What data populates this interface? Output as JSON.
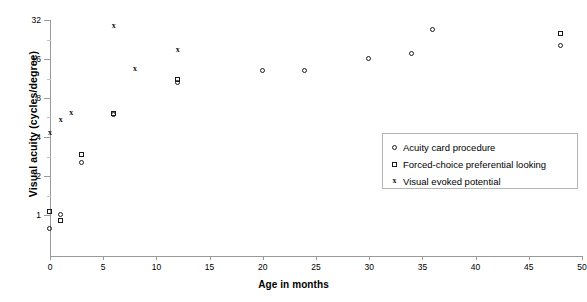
{
  "chart_data": {
    "type": "scatter",
    "title": "",
    "xlabel": "Age in months",
    "ylabel": "Visual acuity (cycles/degree)",
    "xlim": [
      0,
      50
    ],
    "ylim": [
      1,
      32
    ],
    "yscale": "log2",
    "grid": false,
    "legend_position": "center-right",
    "xticks": [
      "0",
      "5",
      "10",
      "15",
      "20",
      "25",
      "30",
      "35",
      "40",
      "45",
      "50"
    ],
    "yticks": [
      "1",
      "2",
      "4",
      "8",
      "16",
      "32"
    ],
    "series": [
      {
        "name": "Acuity card procedure",
        "marker": "circle",
        "points": [
          {
            "x": 0.0,
            "y": 0.78
          },
          {
            "x": 1.0,
            "y": 1.0
          },
          {
            "x": 3.0,
            "y": 2.5
          },
          {
            "x": 6.0,
            "y": 5.9
          },
          {
            "x": 12.0,
            "y": 10.5
          },
          {
            "x": 20.0,
            "y": 13.0
          },
          {
            "x": 24.0,
            "y": 13.0
          },
          {
            "x": 30.0,
            "y": 16.0
          },
          {
            "x": 34.0,
            "y": 17.5
          },
          {
            "x": 36.0,
            "y": 27.0
          },
          {
            "x": 48.0,
            "y": 20.0
          }
        ]
      },
      {
        "name": "Forced-choice preferential looking",
        "marker": "square",
        "points": [
          {
            "x": 0.0,
            "y": 1.05
          },
          {
            "x": 1.0,
            "y": 0.9
          },
          {
            "x": 3.0,
            "y": 2.9
          },
          {
            "x": 6.0,
            "y": 6.0
          },
          {
            "x": 12.0,
            "y": 11.0
          },
          {
            "x": 48.0,
            "y": 25.0
          }
        ]
      },
      {
        "name": "Visual evoked potential",
        "marker": "cross",
        "points": [
          {
            "x": 0.0,
            "y": 4.3
          },
          {
            "x": 1.0,
            "y": 5.5
          },
          {
            "x": 2.0,
            "y": 6.2
          },
          {
            "x": 6.0,
            "y": 29.0
          },
          {
            "x": 8.0,
            "y": 13.5
          },
          {
            "x": 12.0,
            "y": 19.0
          }
        ]
      }
    ]
  },
  "axes": {
    "y_title": "Visual acuity (cycles/degree)",
    "x_title": "Age in months"
  },
  "legend": {
    "items": [
      {
        "symbol": "circle-marker",
        "label": "Acuity card procedure"
      },
      {
        "symbol": "square-marker",
        "label": "Forced-choice preferential looking"
      },
      {
        "symbol": "cross-marker",
        "label": "Visual evoked potential"
      }
    ]
  },
  "style": {
    "axis_color": "#9a9a9a",
    "marker_color": "#1a1a1a",
    "legend_border": "#b5b5b5",
    "background": "#ffffff"
  }
}
